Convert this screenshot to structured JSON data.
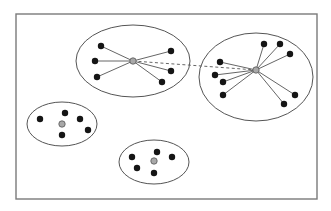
{
  "colors": {
    "background": "#ffffff",
    "frame": "#7a7a7a",
    "ellipse": "#555555",
    "edge": "#666666",
    "node": "#151515",
    "hub": "#a8a8a8",
    "hub_stroke": "#555555"
  },
  "frame": {
    "x": 16,
    "y": 14,
    "w": 301,
    "h": 185
  },
  "clusters": [
    {
      "id": "cluster-top-center",
      "ellipse": {
        "cx": 133,
        "cy": 61,
        "rx": 57,
        "ry": 36
      },
      "hub": {
        "x": 133,
        "y": 61
      },
      "connected": true,
      "nodes": [
        {
          "x": 101,
          "y": 46
        },
        {
          "x": 95,
          "y": 61
        },
        {
          "x": 97,
          "y": 77
        },
        {
          "x": 171,
          "y": 51
        },
        {
          "x": 171,
          "y": 71
        },
        {
          "x": 162,
          "y": 82
        }
      ]
    },
    {
      "id": "cluster-top-right",
      "ellipse": {
        "cx": 256,
        "cy": 77,
        "rx": 57,
        "ry": 44
      },
      "hub": {
        "x": 256,
        "y": 70
      },
      "connected": true,
      "nodes": [
        {
          "x": 220,
          "y": 62
        },
        {
          "x": 215,
          "y": 75
        },
        {
          "x": 223,
          "y": 82
        },
        {
          "x": 223,
          "y": 95
        },
        {
          "x": 264,
          "y": 44
        },
        {
          "x": 280,
          "y": 44
        },
        {
          "x": 290,
          "y": 54
        },
        {
          "x": 295,
          "y": 95
        },
        {
          "x": 284,
          "y": 104
        }
      ]
    },
    {
      "id": "cluster-middle-left",
      "ellipse": {
        "cx": 62,
        "cy": 124,
        "rx": 35,
        "ry": 22
      },
      "hub": {
        "x": 62,
        "y": 124
      },
      "connected": false,
      "nodes": [
        {
          "x": 40,
          "y": 119
        },
        {
          "x": 65,
          "y": 113
        },
        {
          "x": 80,
          "y": 119
        },
        {
          "x": 88,
          "y": 130
        },
        {
          "x": 62,
          "y": 135
        }
      ]
    },
    {
      "id": "cluster-bottom-center",
      "ellipse": {
        "cx": 154,
        "cy": 162,
        "rx": 35,
        "ry": 22
      },
      "hub": {
        "x": 154,
        "y": 161
      },
      "connected": false,
      "nodes": [
        {
          "x": 132,
          "y": 157
        },
        {
          "x": 157,
          "y": 152
        },
        {
          "x": 172,
          "y": 157
        },
        {
          "x": 137,
          "y": 168
        },
        {
          "x": 154,
          "y": 173
        }
      ]
    }
  ],
  "inter_hub_link": {
    "from": "cluster-top-center",
    "to": "cluster-top-right",
    "style": "dashed"
  }
}
